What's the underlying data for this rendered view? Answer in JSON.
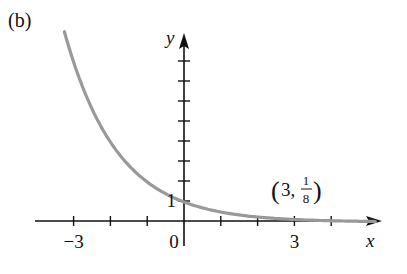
{
  "panel_label": "(b)",
  "chart_data": {
    "type": "line",
    "title": "",
    "function": "y = (1/2)^x",
    "xlabel": "x",
    "ylabel": "y",
    "x_tick_labels": [
      {
        "value": -3,
        "label": "−3"
      },
      {
        "value": 0,
        "label": "0"
      },
      {
        "value": 3,
        "label": "3"
      }
    ],
    "y_tick_labels": [
      {
        "value": 1,
        "label": "1"
      }
    ],
    "x_ticks": [
      -3,
      -2,
      -1,
      1,
      2,
      3,
      4
    ],
    "y_ticks": [
      1,
      2,
      3,
      4,
      5,
      6,
      7,
      8
    ],
    "xlim": [
      -4,
      5.3
    ],
    "ylim": [
      -1,
      9.5
    ],
    "grid": false,
    "legend": null,
    "series": [
      {
        "name": "y = (1/2)^x",
        "color": "#999999",
        "x": [
          -3.25,
          -3,
          -2,
          -1,
          0,
          1,
          2,
          3,
          4,
          5
        ],
        "values": [
          9.51,
          8,
          4,
          2,
          1,
          0.5,
          0.25,
          0.125,
          0.0625,
          0.03125
        ]
      }
    ],
    "annotations": [
      {
        "text": "(3, 1/8)",
        "x": 3,
        "y": 0.125,
        "label_parts": {
          "open": "(3,",
          "num": "1",
          "den": "8",
          "close": ")"
        }
      }
    ]
  }
}
